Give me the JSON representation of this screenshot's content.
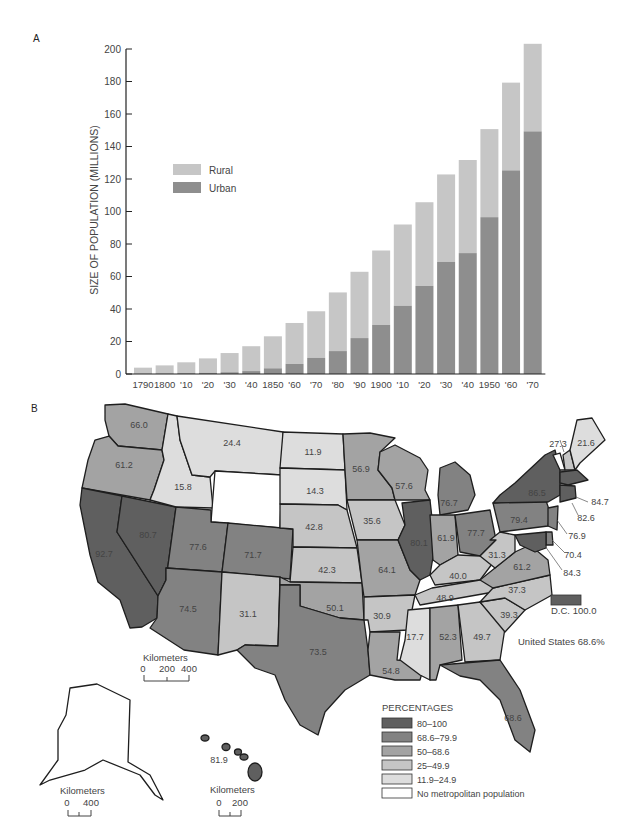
{
  "panels": {
    "a_label": "A",
    "b_label": "B"
  },
  "chart_data": [
    {
      "type": "bar",
      "stacked": true,
      "title": "",
      "xlabel": "",
      "ylabel": "SIZE OF POPULATION (MILLIONS)",
      "ylim": [
        0,
        200
      ],
      "yticks": [
        0,
        20,
        40,
        60,
        80,
        100,
        120,
        140,
        160,
        180,
        200
      ],
      "grid": false,
      "legend_position": "upper-left-inside",
      "categories": [
        "1790",
        "1800",
        "'10",
        "'20",
        "'30",
        "'40",
        "1850",
        "'60",
        "'70",
        "'80",
        "'90",
        "1900",
        "'10",
        "'20",
        "'30",
        "'40",
        "1950",
        "'60",
        "'70"
      ],
      "series": [
        {
          "name": "Urban",
          "color": "#8e8e8e",
          "values": [
            0.2,
            0.3,
            0.5,
            0.7,
            1.1,
            1.8,
            3.5,
            6.2,
            9.9,
            14.1,
            22.1,
            30.2,
            42.0,
            54.2,
            69.0,
            74.4,
            96.5,
            125.3,
            149.3
          ]
        },
        {
          "name": "Rural",
          "color": "#c6c6c6",
          "values": [
            3.7,
            5.0,
            6.7,
            8.9,
            11.8,
            15.3,
            19.7,
            25.2,
            28.7,
            36.1,
            40.8,
            45.8,
            50.0,
            51.5,
            53.8,
            57.3,
            54.2,
            54.0,
            53.9
          ]
        }
      ],
      "totals": [
        3.9,
        5.3,
        7.2,
        9.6,
        12.9,
        17.1,
        23.2,
        31.4,
        38.6,
        50.2,
        62.9,
        76.0,
        92.0,
        105.7,
        122.8,
        131.7,
        150.7,
        179.3,
        203.2
      ]
    },
    {
      "type": "choropleth",
      "title": "Percent of state population in metropolitan areas",
      "national_note": "United States 68.6%",
      "dc_note": "D.C. 100.0",
      "legend_title": "PERCENTAGES",
      "classes": [
        {
          "label": "80–100",
          "color": "#5f5f5f"
        },
        {
          "label": "68.6–79.9",
          "color": "#828282"
        },
        {
          "label": "50–68.6",
          "color": "#a3a3a3"
        },
        {
          "label": "25–49.9",
          "color": "#c5c5c5"
        },
        {
          "label": "11.9–24.9",
          "color": "#dddddd"
        },
        {
          "label": "No metropolitan population",
          "color": "#ffffff"
        }
      ],
      "states": {
        "WA": 66.0,
        "OR": 61.2,
        "CA": 92.7,
        "NV": 80.7,
        "ID": 15.8,
        "MT": 24.4,
        "WY": null,
        "UT": 77.6,
        "CO": 71.7,
        "AZ": 74.5,
        "NM": 31.1,
        "ND": 11.9,
        "SD": 14.3,
        "NE": 42.8,
        "KS": 42.3,
        "OK": 50.1,
        "TX": 73.5,
        "MN": 56.9,
        "IA": 35.6,
        "MO": 64.1,
        "AR": 30.9,
        "LA": 54.8,
        "WI": 57.6,
        "IL": 80.1,
        "MI": 76.7,
        "IN": 61.9,
        "OH": 77.7,
        "KY": 40.0,
        "TN": 48.9,
        "MS": 17.7,
        "AL": 52.3,
        "GA": 49.7,
        "FL": 68.6,
        "SC": 39.3,
        "NC": 37.3,
        "VA": 61.2,
        "WV": 31.3,
        "PA": 79.4,
        "NY": 86.5,
        "VT": null,
        "NH": 27.3,
        "ME": 21.6,
        "MA_RI_CT": 84.7,
        "NJ": 76.9,
        "DE": 70.4,
        "MD": 84.3,
        "CT_RI": 82.6,
        "AK": null,
        "HI": 81.9
      }
    }
  ],
  "chart_text": {
    "ylabel": "SIZE OF POPULATION (MILLIONS)",
    "legend_rural": "Rural",
    "legend_urban": "Urban"
  },
  "map_text": {
    "legend_title": "PERCENTAGES",
    "legend_items": [
      "80–100",
      "68.6–79.9",
      "50–68.6",
      "25–49.9",
      "11.9–24.9",
      "No metropolitan population"
    ],
    "us_note": "United States 68.6%",
    "dc_note": "D.C. 100.0",
    "scale_main_title": "Kilometers",
    "scale_main_ticks": [
      "0",
      "200",
      "400"
    ],
    "scale_alaska_title": "Kilometers",
    "scale_alaska_ticks": [
      "0",
      "400"
    ],
    "scale_hawaii_title": "Kilometers",
    "scale_hawaii_ticks": [
      "0",
      "200"
    ],
    "labels": {
      "WA": "66.0",
      "OR": "61.2",
      "CA": "92.7",
      "NV": "80.7",
      "ID": "15.8",
      "MT": "24.4",
      "UT": "77.6",
      "CO": "71.7",
      "AZ": "74.5",
      "NM": "31.1",
      "ND": "11.9",
      "SD": "14.3",
      "NE": "42.8",
      "KS": "42.3",
      "OK": "50.1",
      "TX": "73.5",
      "MN": "56.9",
      "IA": "35.6",
      "MO": "64.1",
      "AR": "30.9",
      "LA": "54.8",
      "WI": "57.6",
      "IL": "80.1",
      "MI": "76.7",
      "IN": "61.9",
      "OH": "77.7",
      "KY": "40.0",
      "TN": "48.9",
      "MS": "17.7",
      "AL": "52.3",
      "GA": "49.7",
      "FL": "68.6",
      "SC": "39.3",
      "NC": "37.3",
      "VA": "61.2",
      "WV": "31.3",
      "PA": "79.4",
      "NY": "86.5",
      "NH": "27.3",
      "ME": "21.6",
      "MA": "84.7",
      "CT": "82.6",
      "NJ": "76.9",
      "DE": "70.4",
      "MD": "84.3",
      "HI": "81.9"
    }
  }
}
